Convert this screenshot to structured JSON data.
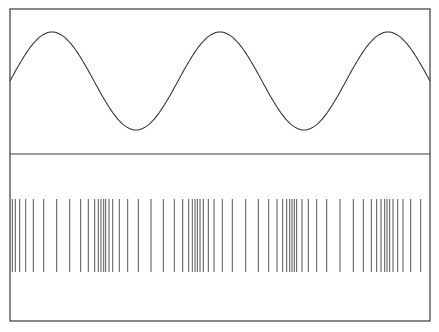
{
  "figure": {
    "width": 439,
    "height": 332,
    "frame": {
      "x": 10,
      "y": 9,
      "width": 420,
      "height": 312,
      "divider_y": 154
    },
    "colors": {
      "stroke": "#3a3a3a",
      "background": "#ffffff",
      "spike": "#555555"
    }
  },
  "top_panel": {
    "type": "sine_wave",
    "x_start": 10,
    "x_end": 430,
    "center_y": 81,
    "amplitude": 49,
    "period_px": 168,
    "peak_x": [
      53,
      221,
      389
    ],
    "trough_x": [
      137,
      305
    ]
  },
  "bottom_panel": {
    "type": "spike_raster",
    "y_top": 199,
    "y_bottom": 272,
    "spike_x": [
      12.3,
      15.3,
      19.7,
      25.7,
      33.3,
      43.7,
      56.7,
      69.7,
      80.7,
      88.3,
      94.7,
      98.3,
      101,
      103.7,
      105.7,
      109,
      112.7,
      119.3,
      127.7,
      138.3,
      151,
      163.3,
      174.3,
      182.7,
      188.7,
      192.3,
      195,
      197.3,
      200,
      203.3,
      208.3,
      214,
      222.3,
      232.3,
      245.7,
      258.3,
      268.7,
      277,
      282.7,
      286.7,
      289.7,
      292,
      294.3,
      296.7,
      302,
      308.3,
      316.7,
      326.7,
      340,
      353.3,
      363.3,
      371.3,
      376.7,
      381,
      384.7,
      387,
      389.7,
      393,
      397.7,
      403,
      410.7,
      420.7
    ]
  }
}
